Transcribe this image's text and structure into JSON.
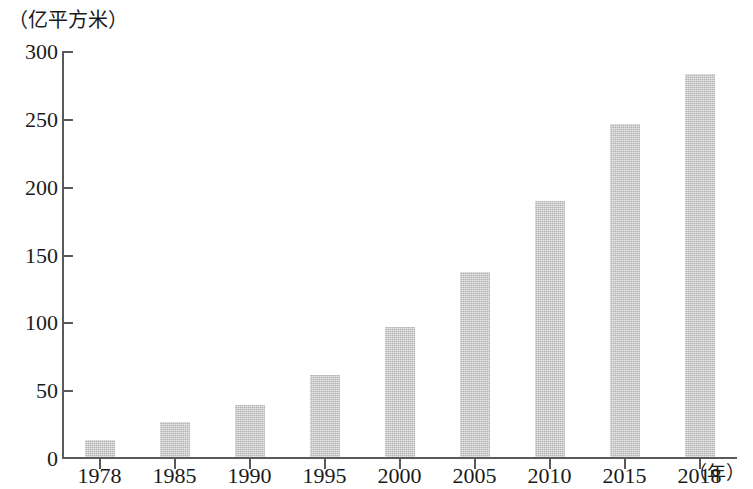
{
  "chart_data": {
    "type": "bar",
    "title": "",
    "subtitle": "",
    "xlabel": "年",
    "ylabel": "亿平方米",
    "y_unit_caption": "（亿平方米）",
    "x_unit_caption": "（年）",
    "categories": [
      "1978",
      "1985",
      "1990",
      "1995",
      "2000",
      "2005",
      "2010",
      "2015",
      "2018"
    ],
    "values": [
      14,
      27,
      40,
      62,
      97,
      138,
      190,
      247,
      284
    ],
    "ylim": [
      0,
      300
    ],
    "yticks": [
      0,
      50,
      100,
      150,
      200,
      250,
      300
    ],
    "ytick_labels": [
      "0",
      "50",
      "100",
      "150",
      "200",
      "250",
      "300"
    ],
    "grid": false,
    "legend": null,
    "bar_color": "#c6c6c6",
    "axis_color": "#5a5a5a"
  }
}
